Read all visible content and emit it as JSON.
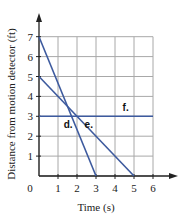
{
  "chart_data": {
    "type": "line",
    "title": "",
    "xlabel": "Time (s)",
    "ylabel": "Distance from motion detector (ft)",
    "xlim": [
      0,
      6
    ],
    "ylim": [
      0,
      7
    ],
    "x_ticks": [
      0,
      1,
      2,
      3,
      4,
      5,
      6
    ],
    "y_ticks": [
      1,
      2,
      3,
      4,
      5,
      6,
      7
    ],
    "origin_label": "0",
    "grid": true,
    "legend": "none",
    "series": [
      {
        "name": "d.",
        "points": [
          [
            0,
            7
          ],
          [
            3,
            0
          ]
        ],
        "label_pos": [
          1.3,
          2.4
        ]
      },
      {
        "name": "e.",
        "points": [
          [
            0,
            5
          ],
          [
            5,
            0
          ]
        ],
        "label_pos": [
          2.4,
          2.4
        ]
      },
      {
        "name": "f.",
        "points": [
          [
            0,
            3
          ],
          [
            6,
            3
          ]
        ],
        "label_pos": [
          4.4,
          3.25
        ]
      }
    ],
    "colors": {
      "line": "#3d5a9e",
      "grid": "#a8a8a8",
      "axis": "#222222"
    }
  }
}
